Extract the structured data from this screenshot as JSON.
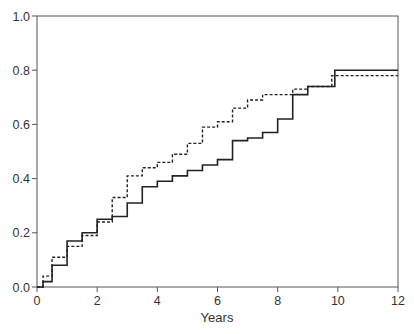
{
  "chart_data": {
    "type": "line",
    "title": "",
    "xlabel": "Years",
    "ylabel": "",
    "xlim": [
      0,
      12
    ],
    "ylim": [
      0,
      1.0
    ],
    "x_ticks": [
      "0",
      "2",
      "4",
      "6",
      "8",
      "10",
      "12"
    ],
    "y_ticks": [
      "0.0",
      "0.2",
      "0.4",
      "0.6",
      "0.8",
      "1.0"
    ],
    "grid": false,
    "legend": null,
    "step": true,
    "series": [
      {
        "name": "solid",
        "style": "solid",
        "color": "#222222",
        "points": [
          [
            0,
            0
          ],
          [
            0.2,
            0.02
          ],
          [
            0.5,
            0.08
          ],
          [
            1,
            0.17
          ],
          [
            1.5,
            0.2
          ],
          [
            2,
            0.25
          ],
          [
            2.5,
            0.26
          ],
          [
            3,
            0.31
          ],
          [
            3.5,
            0.37
          ],
          [
            4,
            0.39
          ],
          [
            4.5,
            0.41
          ],
          [
            5,
            0.43
          ],
          [
            5.5,
            0.45
          ],
          [
            6,
            0.47
          ],
          [
            6.5,
            0.54
          ],
          [
            7,
            0.55
          ],
          [
            7.5,
            0.57
          ],
          [
            8,
            0.62
          ],
          [
            8.5,
            0.71
          ],
          [
            9,
            0.74
          ],
          [
            9.8,
            0.74
          ],
          [
            9.9,
            0.8
          ],
          [
            12,
            0.8
          ]
        ]
      },
      {
        "name": "dashed",
        "style": "dashed",
        "color": "#222222",
        "points": [
          [
            0,
            0
          ],
          [
            0.2,
            0.04
          ],
          [
            0.5,
            0.11
          ],
          [
            1,
            0.15
          ],
          [
            1.5,
            0.19
          ],
          [
            2,
            0.24
          ],
          [
            2.5,
            0.33
          ],
          [
            3,
            0.41
          ],
          [
            3.5,
            0.44
          ],
          [
            4,
            0.46
          ],
          [
            4.5,
            0.49
          ],
          [
            5,
            0.53
          ],
          [
            5.5,
            0.59
          ],
          [
            6,
            0.61
          ],
          [
            6.5,
            0.66
          ],
          [
            7,
            0.69
          ],
          [
            7.5,
            0.71
          ],
          [
            8,
            0.71
          ],
          [
            8.5,
            0.73
          ],
          [
            9,
            0.74
          ],
          [
            9.6,
            0.74
          ],
          [
            9.8,
            0.78
          ],
          [
            12,
            0.78
          ]
        ]
      }
    ]
  }
}
